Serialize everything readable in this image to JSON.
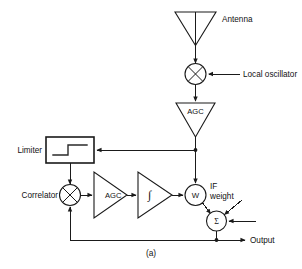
{
  "figure": {
    "caption": "(a)",
    "kind": "block-diagram"
  },
  "colors": {
    "line": "#1a1a1a",
    "background": "#ffffff",
    "text": "#111111"
  },
  "labels": {
    "antenna": "Antenna",
    "local_oscillator": "Local oscillator",
    "agc_rf": "AGC",
    "limiter": "Limiter",
    "correlator": "Correlator",
    "agc_loop": "AGC",
    "integrator": "∫",
    "weight": "W",
    "if_weight_line1": "IF",
    "if_weight_line2": "weight",
    "summer": "Σ",
    "output": "Output"
  },
  "blocks": [
    {
      "name": "antenna",
      "shape": "triangle-down",
      "label": "Antenna",
      "label_position": "right"
    },
    {
      "name": "mixer",
      "shape": "circle-cross",
      "label": "",
      "input_label": "Local oscillator"
    },
    {
      "name": "agc-rf",
      "shape": "triangle-down",
      "label": "AGC"
    },
    {
      "name": "limiter",
      "shape": "rectangle",
      "label": "Limiter",
      "label_position": "left",
      "glyph": "step-function"
    },
    {
      "name": "correlator",
      "shape": "circle-cross",
      "label": "Correlator",
      "label_position": "left"
    },
    {
      "name": "agc-loop",
      "shape": "triangle-right",
      "label": "AGC"
    },
    {
      "name": "integrator",
      "shape": "triangle-right",
      "label": "∫"
    },
    {
      "name": "if-weight",
      "shape": "circle",
      "label": "W",
      "annotation_line1": "IF",
      "annotation_line2": "weight"
    },
    {
      "name": "summer",
      "shape": "circle",
      "label": "Σ",
      "output_label": "Output"
    }
  ]
}
